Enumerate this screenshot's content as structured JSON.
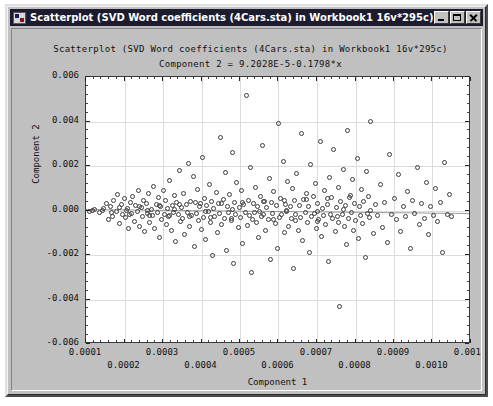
{
  "window": {
    "title": "Scatterplot (SVD Word coefficients (4Cars.sta) in Workbook1 16v*295c)*",
    "icon": "scatterplot-window-icon",
    "minimize_label": "_",
    "maximize_label": "□",
    "close_label": "×",
    "background_color": "#c0c0c0",
    "titlebar_color": "#1c1c2e"
  },
  "chart_data": {
    "type": "scatter",
    "title": "Scatterplot (SVD Word coefficients (4Cars.sta) in Workbook1 16v*295c)",
    "subtitle": "Component 2 = 9.2028E-5-0.1798*x",
    "equation": {
      "intercept": "9.2028E-5",
      "slope": "-0.1798",
      "expression": "Component 2 = 9.2028E-5-0.1798*x"
    },
    "xlabel": "Component 1",
    "ylabel": "Component 2",
    "xlim": [
      0.0001,
      0.0011
    ],
    "ylim": [
      -0.006,
      0.006
    ],
    "xticks": [
      0.0001,
      0.0002,
      0.0003,
      0.0004,
      0.0005,
      0.0006,
      0.0007,
      0.0008,
      0.0009,
      0.001,
      0.0011
    ],
    "xticklabels": [
      "0.0001",
      "0.0002",
      "0.0003",
      "0.0004",
      "0.0005",
      "0.0006",
      "0.0007",
      "0.0008",
      "0.0009",
      "0.0010",
      "0.0011"
    ],
    "xtick_stagger": true,
    "yticks": [
      -0.006,
      -0.004,
      -0.002,
      0.0,
      0.002,
      0.004,
      0.006
    ],
    "yticklabels": [
      "-0.006",
      "-0.004",
      "-0.002",
      "0.000",
      "0.002",
      "0.004",
      "0.006"
    ],
    "grid": true,
    "minor_ticks_per_major": 5,
    "marker": "open-circle",
    "marker_color": "#3c3c3c",
    "regression_line_color": "#9a9a9a",
    "n_points": 295,
    "points": [
      [
        0.000108,
        -3e-05
      ],
      [
        0.000122,
        6e-05
      ],
      [
        0.000135,
        -0.00011
      ],
      [
        0.000143,
        2e-05
      ],
      [
        0.000152,
        0.00033
      ],
      [
        0.000158,
        -0.00042
      ],
      [
        0.000163,
        0.00018
      ],
      [
        0.000168,
        -0.00025
      ],
      [
        0.000172,
        0.00045
      ],
      [
        0.000178,
        -5e-05
      ],
      [
        0.000182,
        0.0007
      ],
      [
        0.000186,
        -0.0006
      ],
      [
        0.000191,
        0.00025
      ],
      [
        0.000195,
        -0.00018
      ],
      [
        0.000199,
        0.00055
      ],
      [
        0.000203,
        -0.00033
      ],
      [
        0.000207,
        0.0001
      ],
      [
        0.000211,
        -0.0008
      ],
      [
        0.000215,
        0.00038
      ],
      [
        0.000218,
        -0.00012
      ],
      [
        0.000222,
        0.00062
      ],
      [
        0.000226,
        -0.00048
      ],
      [
        0.000229,
        0.00021
      ],
      [
        0.000233,
        -6e-05
      ],
      [
        0.000236,
        0.00088
      ],
      [
        0.00024,
        -0.0007
      ],
      [
        0.000243,
        0.00015
      ],
      [
        0.000247,
        -0.00029
      ],
      [
        0.00025,
        0.00047
      ],
      [
        0.000253,
        -0.00095
      ],
      [
        0.000256,
        0.00032
      ],
      [
        0.00026,
        -0.00014
      ],
      [
        0.000263,
        0.00076
      ],
      [
        0.000266,
        -0.00054
      ],
      [
        0.000269,
        4e-05
      ],
      [
        0.000272,
        -0.00023
      ],
      [
        0.000276,
        0.0011
      ],
      [
        0.000279,
        -0.00082
      ],
      [
        0.000282,
        0.00029
      ],
      [
        0.000285,
        -7e-05
      ],
      [
        0.000288,
        0.00058
      ],
      [
        0.000291,
        -0.0012
      ],
      [
        0.000294,
        0.00019
      ],
      [
        0.000297,
        -0.00039
      ],
      [
        0.0003,
        0.0009
      ],
      [
        0.000303,
        -0.00016
      ],
      [
        0.000306,
        0.00043
      ],
      [
        0.000309,
        -0.00064
      ],
      [
        0.000312,
        8e-05
      ],
      [
        0.000315,
        -0.00027
      ],
      [
        0.000318,
        0.00135
      ],
      [
        0.000321,
        -0.0009
      ],
      [
        0.000324,
        0.00024
      ],
      [
        0.000327,
        -0.0001
      ],
      [
        0.00033,
        0.00066
      ],
      [
        0.000333,
        -0.0014
      ],
      [
        0.000336,
        0.00036
      ],
      [
        0.000339,
        -0.0002
      ],
      [
        0.000342,
        0.0018
      ],
      [
        0.000345,
        -0.0005
      ],
      [
        0.000348,
        0.00013
      ],
      [
        0.000351,
        -0.00034
      ],
      [
        0.000354,
        0.00078
      ],
      [
        0.000357,
        -0.0011
      ],
      [
        0.00036,
        0.00026
      ],
      [
        0.000363,
        -8e-05
      ],
      [
        0.000366,
        0.0021
      ],
      [
        0.000369,
        -0.00072
      ],
      [
        0.000372,
        0.00041
      ],
      [
        0.000375,
        -0.00021
      ],
      [
        0.000378,
        0.00155
      ],
      [
        0.000381,
        -0.0016
      ],
      [
        0.000384,
        0.00034
      ],
      [
        0.000387,
        -0.00013
      ],
      [
        0.00039,
        0.00094
      ],
      [
        0.000393,
        -0.00046
      ],
      [
        0.000396,
        0.00017
      ],
      [
        0.000399,
        -0.00087
      ],
      [
        0.000402,
        0.0024
      ],
      [
        0.000405,
        -0.0003
      ],
      [
        0.000408,
        0.00052
      ],
      [
        0.000411,
        -0.0013
      ],
      [
        0.000414,
        0.00022
      ],
      [
        0.000417,
        -6e-05
      ],
      [
        0.00042,
        0.00115
      ],
      [
        0.000423,
        -0.00056
      ],
      [
        0.000426,
        0.00039
      ],
      [
        0.000429,
        -0.002
      ],
      [
        0.000432,
        0.00011
      ],
      [
        0.000435,
        -0.00025
      ],
      [
        0.000438,
        0.00083
      ],
      [
        0.000441,
        -0.001
      ],
      [
        0.000444,
        0.0003
      ],
      [
        0.000447,
        -0.00015
      ],
      [
        0.00045,
        0.0033
      ],
      [
        0.000453,
        -0.00062
      ],
      [
        0.000456,
        0.00048
      ],
      [
        0.000459,
        -0.00035
      ],
      [
        0.000462,
        0.0017
      ],
      [
        0.000465,
        -0.0018
      ],
      [
        0.000468,
        0.0002
      ],
      [
        0.000471,
        -9e-05
      ],
      [
        0.000474,
        0.00071
      ],
      [
        0.000477,
        -0.00043
      ],
      [
        0.00048,
        0.0026
      ],
      [
        0.000483,
        -0.0024
      ],
      [
        0.000486,
        0.00037
      ],
      [
        0.000489,
        -0.00018
      ],
      [
        0.000492,
        0.00125
      ],
      [
        0.000495,
        -0.00078
      ],
      [
        0.000498,
        0.00014
      ],
      [
        0.000501,
        -0.00031
      ],
      [
        0.000504,
        0.0009
      ],
      [
        0.000507,
        -0.0015
      ],
      [
        0.00051,
        0.00026
      ],
      [
        0.000513,
        -0.00011
      ],
      [
        0.000516,
        0.00515
      ],
      [
        0.000519,
        -0.00068
      ],
      [
        0.000522,
        0.00045
      ],
      [
        0.000525,
        -0.00024
      ],
      [
        0.000528,
        0.00195
      ],
      [
        0.000531,
        -0.0028
      ],
      [
        0.000534,
        0.00032
      ],
      [
        0.000537,
        -7e-05
      ],
      [
        0.00054,
        0.00105
      ],
      [
        0.000543,
        -0.00052
      ],
      [
        0.000546,
        0.00018
      ],
      [
        0.000549,
        -0.0012
      ],
      [
        0.000552,
        0.00062
      ],
      [
        0.000555,
        -0.00028
      ],
      [
        0.000558,
        0.0029
      ],
      [
        0.000561,
        -0.00016
      ],
      [
        0.000564,
        0.0004
      ],
      [
        0.000567,
        -0.0009
      ],
      [
        0.00057,
        0.00012
      ],
      [
        0.000573,
        -0.0004
      ],
      [
        0.000576,
        0.00145
      ],
      [
        0.000579,
        -0.0022
      ],
      [
        0.000582,
        0.00035
      ],
      [
        0.000585,
        -0.00013
      ],
      [
        0.000588,
        0.00085
      ],
      [
        0.000591,
        -0.0006
      ],
      [
        0.000594,
        0.00021
      ],
      [
        0.000597,
        -0.0017
      ],
      [
        0.0006,
        0.0039
      ],
      [
        0.000603,
        -0.00033
      ],
      [
        0.000606,
        0.00056
      ],
      [
        0.000609,
        -0.0002
      ],
      [
        0.000612,
        0.0022
      ],
      [
        0.000615,
        -0.001
      ],
      [
        0.000618,
        0.00029
      ],
      [
        0.000621,
        -5e-05
      ],
      [
        0.000624,
        0.0013
      ],
      [
        0.000627,
        -0.00074
      ],
      [
        0.00063,
        0.00016
      ],
      [
        0.000633,
        -0.00038
      ],
      [
        0.000636,
        0.00098
      ],
      [
        0.000639,
        -0.0026
      ],
      [
        0.000642,
        0.00043
      ],
      [
        0.000645,
        -0.00017
      ],
      [
        0.000648,
        0.00165
      ],
      [
        0.000651,
        -0.00088
      ],
      [
        0.000654,
        0.00024
      ],
      [
        0.000657,
        -0.0003
      ],
      [
        0.00066,
        0.00345
      ],
      [
        0.000663,
        -0.00135
      ],
      [
        0.000666,
        0.00051
      ],
      [
        0.000669,
        -0.0001
      ],
      [
        0.000672,
        0.00076
      ],
      [
        0.000675,
        -0.00055
      ],
      [
        0.000678,
        0.00019
      ],
      [
        0.000681,
        -0.0019
      ],
      [
        0.000684,
        0.00205
      ],
      [
        0.000687,
        -0.00026
      ],
      [
        0.00069,
        0.00064
      ],
      [
        0.000693,
        -0.00014
      ],
      [
        0.000696,
        0.0012
      ],
      [
        0.000699,
        -0.00082
      ],
      [
        0.000702,
        0.00033
      ],
      [
        0.000705,
        -0.00042
      ],
      [
        0.000708,
        0.0031
      ],
      [
        0.000711,
        -0.00115
      ],
      [
        0.000714,
        8e-05
      ],
      [
        0.000717,
        -0.00023
      ],
      [
        0.00072,
        0.00089
      ],
      [
        0.000723,
        -0.00064
      ],
      [
        0.000726,
        0.00027
      ],
      [
        0.000729,
        -0.0023
      ],
      [
        0.000732,
        0.0015
      ],
      [
        0.000735,
        -0.00019
      ],
      [
        0.000738,
        0.00058
      ],
      [
        0.000741,
        -0.00036
      ],
      [
        0.000744,
        0.00275
      ],
      [
        0.000747,
        -0.00096
      ],
      [
        0.00075,
        0.00013
      ],
      [
        0.000753,
        -0.00029
      ],
      [
        0.000756,
        0.00105
      ],
      [
        0.000759,
        -0.0043
      ],
      [
        0.000762,
        0.00039
      ],
      [
        0.000765,
        -0.00016
      ],
      [
        0.000768,
        0.00185
      ],
      [
        0.000771,
        -0.0007
      ],
      [
        0.000774,
        0.00022
      ],
      [
        0.000777,
        -0.00155
      ],
      [
        0.00078,
        0.0036
      ],
      [
        0.000783,
        -0.00034
      ],
      [
        0.000786,
        0.00069
      ],
      [
        0.000789,
        -0.00011
      ],
      [
        0.000792,
        0.0014
      ],
      [
        0.000795,
        -0.00089
      ],
      [
        0.000798,
        0.0003
      ],
      [
        0.000801,
        -0.00047
      ],
      [
        0.000804,
        0.00235
      ],
      [
        0.000807,
        -0.00125
      ],
      [
        0.00081,
        0.00018
      ],
      [
        0.000813,
        -0.00021
      ],
      [
        0.000816,
        0.00094
      ],
      [
        0.000819,
        -0.00058
      ],
      [
        0.000822,
        0.00041
      ],
      [
        0.000825,
        -0.0021
      ],
      [
        0.000828,
        0.00175
      ],
      [
        0.000831,
        -0.00015
      ],
      [
        0.000834,
        0.00062
      ],
      [
        0.000837,
        -0.00032
      ],
      [
        0.00084,
        0.004
      ],
      [
        0.000846,
        -0.00105
      ],
      [
        0.000852,
        0.00025
      ],
      [
        0.000858,
        -0.00024
      ],
      [
        0.000864,
        0.00115
      ],
      [
        0.00087,
        -0.00076
      ],
      [
        0.000876,
        0.00034
      ],
      [
        0.000882,
        -0.00145
      ],
      [
        0.000888,
        0.0025
      ],
      [
        0.000894,
        -0.00018
      ],
      [
        0.0009,
        0.00053
      ],
      [
        0.000906,
        -0.00039
      ],
      [
        0.000912,
        0.0016
      ],
      [
        0.000918,
        -0.00095
      ],
      [
        0.000924,
        0.0002
      ],
      [
        0.00093,
        -0.00027
      ],
      [
        0.000936,
        0.00087
      ],
      [
        0.000942,
        -0.0017
      ],
      [
        0.000948,
        0.00044
      ],
      [
        0.000954,
        -0.00013
      ],
      [
        0.00096,
        0.00195
      ],
      [
        0.000966,
        -0.00062
      ],
      [
        0.000972,
        0.00031
      ],
      [
        0.000978,
        -0.00035
      ],
      [
        0.000984,
        0.00125
      ],
      [
        0.00099,
        -0.0011
      ],
      [
        0.000996,
        0.00017
      ],
      [
        0.001002,
        -0.00022
      ],
      [
        0.001008,
        0.00098
      ],
      [
        0.001014,
        -0.0005
      ],
      [
        0.00102,
        0.00036
      ],
      [
        0.001026,
        -0.0019
      ],
      [
        0.001032,
        0.00215
      ],
      [
        0.001038,
        -0.00016
      ],
      [
        0.001044,
        0.0007
      ],
      [
        0.00105,
        -0.00029
      ],
      [
        0.000205,
        5e-06
      ],
      [
        0.00026,
        -1.5e-05
      ],
      [
        0.00033,
        2.5e-05
      ],
      [
        0.00041,
        -3.5e-05
      ],
      [
        0.00048,
        4.5e-05
      ],
      [
        0.00055,
        -2.5e-05
      ],
      [
        0.00062,
        1.5e-05
      ],
      [
        0.0007,
        -4.5e-05
      ],
      [
        0.00077,
        3.5e-05
      ],
      [
        0.00084,
        -1e-05
      ],
      [
        0.000118,
        0.0
      ],
      [
        0.000145,
        8.5e-05
      ],
      [
        0.000165,
        -9e-05
      ],
      [
        0.000188,
        0.000135
      ],
      [
        0.000212,
        -0.000165
      ],
      [
        0.000238,
        0.000195
      ],
      [
        0.000264,
        -0.000205
      ],
      [
        0.00029,
        0.000225
      ],
      [
        0.000316,
        -0.000235
      ],
      [
        0.000344,
        0.000265
      ],
      [
        0.00037,
        -0.000275
      ],
      [
        0.000398,
        0.000295
      ],
      [
        0.000424,
        -0.000305
      ],
      [
        0.000452,
        0.000325
      ],
      [
        0.000478,
        -0.000345
      ],
      [
        0.000506,
        0.000365
      ],
      [
        0.000532,
        -0.000385
      ],
      [
        0.00056,
        0.000405
      ],
      [
        0.000588,
        -0.000425
      ],
      [
        0.000616,
        0.000445
      ],
      [
        0.000644,
        -0.000465
      ],
      [
        0.000672,
        0.000485
      ],
      [
        0.0007,
        -0.000505
      ],
      [
        0.000728,
        0.000525
      ],
      [
        0.000756,
        -0.000545
      ],
      [
        0.000784,
        0.000565
      ]
    ]
  }
}
